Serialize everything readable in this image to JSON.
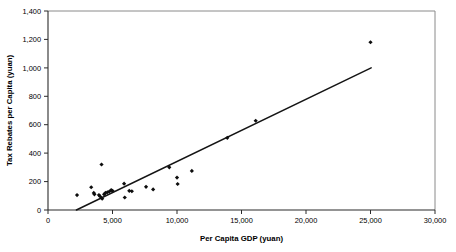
{
  "chart_data": {
    "type": "scatter",
    "title": "",
    "xlabel": "Per Capita GDP (yuan)",
    "ylabel": "Tax Rebates per Capita (yuan)",
    "xlim": [
      0,
      30000
    ],
    "ylim": [
      0,
      1400
    ],
    "xticks": [
      0,
      5000,
      10000,
      15000,
      20000,
      25000,
      30000
    ],
    "yticks": [
      0,
      200,
      400,
      600,
      800,
      1000,
      1200,
      1400
    ],
    "xtick_labels": [
      "0",
      "5,000",
      "10,000",
      "15,000",
      "20,000",
      "25,000",
      "30,000"
    ],
    "ytick_labels": [
      "0",
      "200",
      "400",
      "600",
      "800",
      "1,000",
      "1,200",
      "1,400"
    ],
    "grid": false,
    "legend": null,
    "marker": "diamond",
    "marker_color": "#0d0d0d",
    "points": [
      {
        "x": 2250,
        "y": 105
      },
      {
        "x": 3350,
        "y": 160
      },
      {
        "x": 3550,
        "y": 120
      },
      {
        "x": 3600,
        "y": 110
      },
      {
        "x": 3950,
        "y": 105
      },
      {
        "x": 4050,
        "y": 95
      },
      {
        "x": 4150,
        "y": 320
      },
      {
        "x": 4200,
        "y": 80
      },
      {
        "x": 4350,
        "y": 110
      },
      {
        "x": 4450,
        "y": 120
      },
      {
        "x": 4600,
        "y": 125
      },
      {
        "x": 4750,
        "y": 130
      },
      {
        "x": 4900,
        "y": 140
      },
      {
        "x": 5000,
        "y": 135
      },
      {
        "x": 5900,
        "y": 185
      },
      {
        "x": 5950,
        "y": 88
      },
      {
        "x": 6300,
        "y": 135
      },
      {
        "x": 6500,
        "y": 132
      },
      {
        "x": 7600,
        "y": 163
      },
      {
        "x": 8150,
        "y": 145
      },
      {
        "x": 9400,
        "y": 300
      },
      {
        "x": 10000,
        "y": 228
      },
      {
        "x": 10050,
        "y": 183
      },
      {
        "x": 11150,
        "y": 275
      },
      {
        "x": 13900,
        "y": 508
      },
      {
        "x": 16100,
        "y": 628
      },
      {
        "x": 25000,
        "y": 1180
      }
    ],
    "trendline": {
      "x_start": 2200,
      "y_start": 0,
      "x_end": 25050,
      "y_end": 1000,
      "color": "#141414"
    }
  },
  "axes": {
    "x_title": "Per Capita GDP (yuan)",
    "y_title": "Tax Rebates per Capita (yuan)"
  },
  "ticks": {
    "x": [
      "0",
      "5,000",
      "10,000",
      "15,000",
      "20,000",
      "25,000",
      "30,000"
    ],
    "y": [
      "0",
      "200",
      "400",
      "600",
      "800",
      "1,000",
      "1,200",
      "1,400"
    ]
  }
}
